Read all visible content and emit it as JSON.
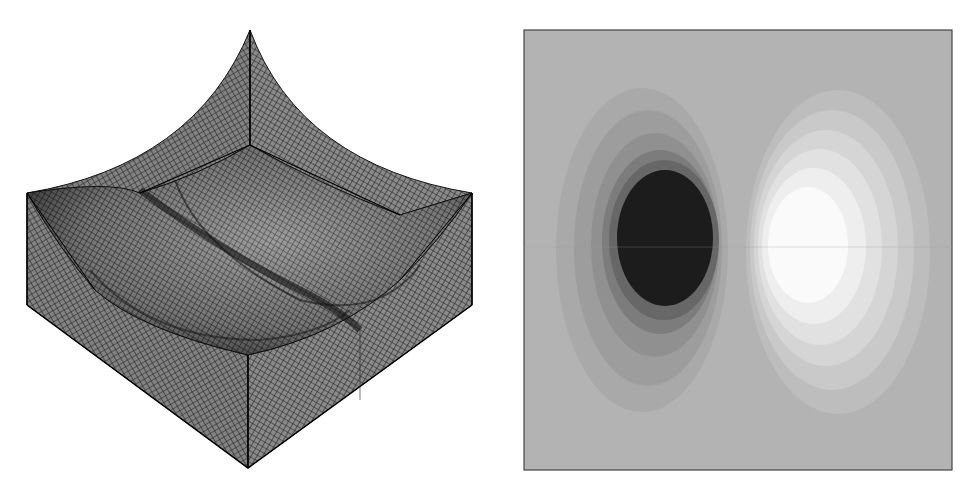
{
  "figure": {
    "left_panel": {
      "kind": "3d-wireframe-mesh-surface",
      "label": "Mesh surface (isometric view)",
      "colors": {
        "mesh_line": "#1a1a1a",
        "mesh_fill": "#7a7a7a",
        "highlight": "#bdbdbd",
        "background": "#ffffff"
      }
    },
    "right_panel": {
      "kind": "filled-contour-plot",
      "label": "Contour plot (dipole pattern)",
      "colors": {
        "background": "#b3b3b3",
        "frame": "#444444",
        "negative_bands": [
          "#a8a8a8",
          "#9c9c9c",
          "#8e8e8e",
          "#7a7a7a",
          "#646464",
          "#1c1c1c"
        ],
        "positive_bands": [
          "#bcbcbc",
          "#c8c8c8",
          "#d4d4d4",
          "#e0e0e0",
          "#ededed",
          "#fafafa"
        ]
      }
    }
  }
}
